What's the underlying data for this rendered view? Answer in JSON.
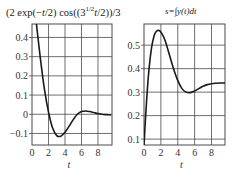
{
  "chart_data": [
    {
      "type": "line",
      "title": "(2 exp(−t/2) cos((3^(1/2) t)/2))/3",
      "title_parts": {
        "pre": "(2 exp(−",
        "t1": "t",
        "mid1": "/2) cos((3",
        "sup": "1/2",
        "t2": "t",
        "post": "/2))/3"
      },
      "xlabel": "t",
      "ylabel": "",
      "xlim": [
        0,
        9.7
      ],
      "ylim": [
        -0.16,
        0.47
      ],
      "xticks": [
        0,
        2,
        4,
        6,
        8
      ],
      "xtick_labels": [
        "0",
        "2",
        "4",
        "6",
        "8"
      ],
      "yticks": [
        -0.1,
        0,
        0.1,
        0.2,
        0.3,
        0.4
      ],
      "ytick_labels": [
        "−0.1",
        "0",
        "0.1",
        "0.2",
        "0.3",
        "0.4"
      ],
      "grid": true,
      "series": [
        {
          "name": "f(t)",
          "x": [
            0,
            0.5,
            1.0,
            1.5,
            2.0,
            2.5,
            3.0,
            3.5,
            4.0,
            4.5,
            5.0,
            5.5,
            6.0,
            6.5,
            7.0,
            7.5,
            8.0,
            8.5,
            9.0,
            9.6
          ],
          "values": [
            0.667,
            0.484,
            0.296,
            0.132,
            0.012,
            -0.072,
            -0.111,
            -0.114,
            -0.094,
            -0.062,
            -0.028,
            0.0,
            0.014,
            0.017,
            0.014,
            0.009,
            0.004,
            0.0,
            -0.002,
            -0.004
          ]
        }
      ]
    },
    {
      "type": "line",
      "title": "s=∫j y(t)dt",
      "title_parts": {
        "text": "s=∫y(t)dt"
      },
      "xlabel": "t",
      "ylabel": "",
      "xlim": [
        0,
        9.6
      ],
      "ylim": [
        0.075,
        0.59
      ],
      "xticks": [
        0,
        2,
        4,
        6,
        8
      ],
      "xtick_labels": [
        "0",
        "2",
        "4",
        "6",
        "8"
      ],
      "yticks": [
        0.1,
        0.2,
        0.3,
        0.4,
        0.5
      ],
      "ytick_labels": [
        "0.1",
        "0.2",
        "0.3",
        "0.4",
        "0.5"
      ],
      "grid": true,
      "series": [
        {
          "name": "s(t)",
          "x": [
            0,
            0.3,
            0.6,
            0.9,
            1.2,
            1.5,
            1.8,
            2.1,
            2.5,
            3.0,
            3.5,
            4.0,
            4.5,
            5.0,
            5.5,
            6.0,
            6.5,
            7.0,
            7.5,
            8.0,
            8.5,
            9.0,
            9.6
          ],
          "values": [
            0.075,
            0.26,
            0.4,
            0.49,
            0.54,
            0.56,
            0.562,
            0.55,
            0.52,
            0.46,
            0.4,
            0.35,
            0.315,
            0.3,
            0.298,
            0.305,
            0.315,
            0.325,
            0.332,
            0.336,
            0.338,
            0.339,
            0.339
          ]
        }
      ]
    }
  ],
  "plots": [
    {
      "frame": {
        "x0": 32,
        "y0": 24,
        "x1": 112,
        "y1": 145
      }
    },
    {
      "frame": {
        "x0": 144,
        "y0": 24,
        "x1": 225,
        "y1": 145
      }
    }
  ],
  "colors": {
    "grid": "#4a4a4a",
    "curve": "#1a1a1a",
    "frame": "#4a4a4a"
  }
}
